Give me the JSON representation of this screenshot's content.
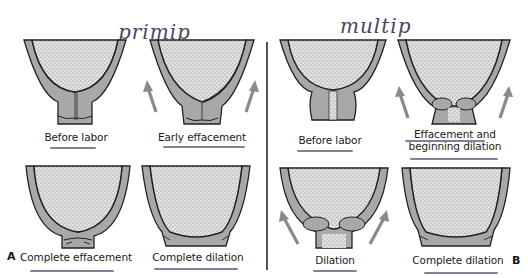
{
  "figure": {
    "handwritten_titles": {
      "left": "primip",
      "right": "multip"
    },
    "panel_markers": {
      "left": "A",
      "right": "B"
    },
    "panels": {
      "A": {
        "group": "primip",
        "stages": [
          {
            "label": "Before labor",
            "arrows": false
          },
          {
            "label": "Early effacement",
            "arrows": true
          },
          {
            "label": "Complete effacement",
            "arrows": false
          },
          {
            "label": "Complete dilation",
            "arrows": false
          }
        ]
      },
      "B": {
        "group": "multip",
        "stages": [
          {
            "label": "Before labor",
            "arrows": false
          },
          {
            "label": "Effacement and beginning dilation",
            "arrows": true
          },
          {
            "label": "Dilation",
            "arrows": true
          },
          {
            "label": "Complete dilation",
            "arrows": false
          }
        ]
      }
    },
    "colors": {
      "background": "#ffffff",
      "fetal_head_stipple": "#bdbdbd",
      "uterine_wall": "#a8a8a8",
      "outline": "#222222",
      "arrow": "#8a8a8a",
      "handwriting_ink": "#4a4560",
      "underline_ink": "#6e6a88"
    }
  }
}
